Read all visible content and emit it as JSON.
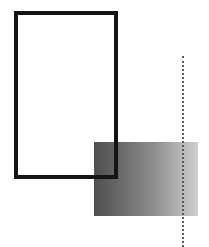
{
  "canvas": {
    "width": 209,
    "height": 247,
    "background": "#ffffff"
  },
  "shapes": [
    {
      "id": "outline-rectangle",
      "type": "rect",
      "x": 14,
      "y": 11,
      "width": 104,
      "height": 168,
      "stroke": "#141414",
      "stroke_width": 4,
      "fill": "none"
    },
    {
      "id": "gradient-rectangle",
      "type": "rect",
      "x": 94,
      "y": 142,
      "width": 104,
      "height": 74,
      "fill_gradient": {
        "direction": "left-to-right",
        "from": "#4e4e4e",
        "to": "#cfcfcf"
      }
    },
    {
      "id": "dotted-vertical-line",
      "type": "line",
      "x": 183,
      "y1": 56,
      "y2": 247,
      "stroke": "#5a5a5a",
      "style": "dotted"
    }
  ]
}
